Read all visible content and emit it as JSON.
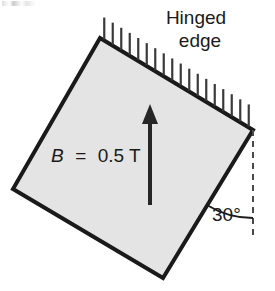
{
  "figure": {
    "caption_labels": {
      "hinged_edge_line1": "Hinged",
      "hinged_edge_line2": "edge",
      "field_symbol": "B",
      "field_equals": "=",
      "field_value": "0.5 T",
      "field_full": "B  =  0.5 T",
      "angle": "30°"
    },
    "colors": {
      "plate_fill": "#e4e4e4",
      "plate_stroke": "#1a1a1a",
      "arrow": "#262626",
      "hatch": "#3a3a3a",
      "dashed_reference": "#4a4a4a",
      "arc": "#1a1a1a",
      "text": "#1a1a1a",
      "background": "#ffffff"
    },
    "geometry": {
      "plate_corners": [
        {
          "name": "top",
          "x": 100,
          "y": 38
        },
        {
          "name": "right",
          "x": 253,
          "y": 130
        },
        {
          "name": "bottom",
          "x": 163,
          "y": 278
        },
        {
          "name": "left",
          "x": 13,
          "y": 189
        }
      ],
      "plate_stroke_width": 4,
      "tilt_angle_deg": 30,
      "arrow": {
        "x": 150,
        "y_tail": 205,
        "y_tip": 104,
        "shaft_width": 4
      },
      "hatch": {
        "count": 18,
        "length": 22,
        "spacing_px": 10
      },
      "dashed_line": {
        "x": 253,
        "y_top": 130,
        "y_bottom": 240
      },
      "arc": {
        "cx": 253,
        "cy": 130,
        "radius": 88,
        "from_deg": 60,
        "to_deg": 90
      }
    },
    "text_positions": {
      "hinged_x": 196,
      "hinged_y": 24,
      "edge_x": 200,
      "edge_y": 47,
      "field_x": 51,
      "field_y": 162,
      "angle_x": 212,
      "angle_y": 221
    },
    "icon_names": {
      "field_arrow": "up-arrow-icon",
      "hatch_marks": "hatching-icon",
      "angle_arc": "angle-arc-icon",
      "reference_line": "dashed-vertical-reference-icon"
    }
  }
}
